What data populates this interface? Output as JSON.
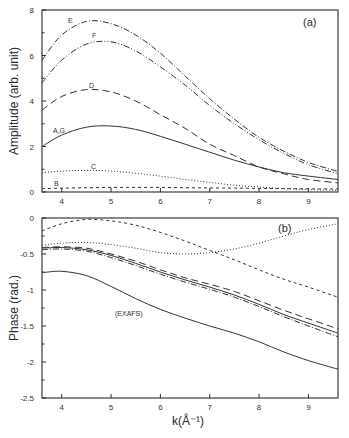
{
  "figure": {
    "xlabel": "k(Å⁻¹)",
    "x_ticks": [
      "4",
      "5",
      "6",
      "7",
      "8",
      "9"
    ]
  },
  "chart_data": [
    {
      "type": "line",
      "panel_label": "(a)",
      "title": "",
      "xlabel": "k(Å⁻¹)",
      "ylabel": "Amplitude (arb. unit)",
      "xlim": [
        3.6,
        9.6
      ],
      "ylim": [
        0,
        8
      ],
      "x_ticks": [
        4,
        5,
        6,
        7,
        8,
        9
      ],
      "y_ticks": [
        0,
        2,
        4,
        6,
        8
      ],
      "y_tick_labels": [
        "0",
        "2",
        "4",
        "6",
        "8"
      ],
      "grid": false,
      "legend": "inline curve labels",
      "x": [
        3.6,
        4.0,
        4.5,
        5.0,
        5.5,
        6.0,
        6.5,
        7.0,
        7.5,
        8.0,
        8.5,
        9.0,
        9.6
      ],
      "series": [
        {
          "name": "E",
          "style": "dash-dot",
          "values": [
            5.8,
            6.9,
            7.5,
            7.4,
            6.9,
            6.1,
            5.1,
            4.1,
            3.2,
            2.4,
            1.8,
            1.3,
            0.9
          ]
        },
        {
          "name": "F",
          "style": "dash-dot-dot",
          "values": [
            4.8,
            5.8,
            6.5,
            6.6,
            6.2,
            5.5,
            4.7,
            3.8,
            3.0,
            2.3,
            1.7,
            1.2,
            0.8
          ]
        },
        {
          "name": "D",
          "style": "dashed",
          "values": [
            3.6,
            4.2,
            4.5,
            4.4,
            4.0,
            3.4,
            2.8,
            2.1,
            1.6,
            1.1,
            0.8,
            0.55,
            0.4
          ]
        },
        {
          "name": "A,G",
          "style": "solid",
          "values": [
            2.0,
            2.5,
            2.85,
            2.9,
            2.75,
            2.45,
            2.1,
            1.75,
            1.4,
            1.1,
            0.85,
            0.7,
            0.55
          ]
        },
        {
          "name": "C",
          "style": "dotted",
          "values": [
            0.85,
            0.92,
            0.95,
            0.92,
            0.82,
            0.7,
            0.55,
            0.42,
            0.3,
            0.22,
            0.15,
            0.1,
            0.08
          ]
        },
        {
          "name": "B",
          "style": "short-dashed",
          "values": [
            0.15,
            0.17,
            0.19,
            0.2,
            0.2,
            0.2,
            0.19,
            0.18,
            0.17,
            0.16,
            0.15,
            0.14,
            0.13
          ]
        }
      ],
      "annotations": [
        "E",
        "F",
        "D",
        "A,G",
        "C",
        "B",
        "(a)"
      ]
    },
    {
      "type": "line",
      "panel_label": "(b)",
      "title": "",
      "xlabel": "k(Å⁻¹)",
      "ylabel": "Phase (rad.)",
      "xlim": [
        3.6,
        9.6
      ],
      "ylim": [
        -2.5,
        0
      ],
      "x_ticks": [
        4,
        5,
        6,
        7,
        8,
        9
      ],
      "y_ticks": [
        0,
        -0.5,
        -1,
        -1.5,
        -2,
        -2.5
      ],
      "y_tick_labels": [
        "0",
        "-0.5",
        "-1",
        "-1.5",
        "-2",
        "-2.5"
      ],
      "grid": false,
      "legend": "inline curve label",
      "x": [
        3.6,
        4.0,
        4.5,
        5.0,
        5.5,
        6.0,
        6.5,
        7.0,
        7.5,
        8.0,
        8.5,
        9.0,
        9.6
      ],
      "series": [
        {
          "name": "short-dashed",
          "style": "short-dashed",
          "values": [
            -0.18,
            -0.08,
            -0.02,
            -0.04,
            -0.1,
            -0.2,
            -0.32,
            -0.45,
            -0.58,
            -0.72,
            -0.85,
            -0.96,
            -1.1
          ]
        },
        {
          "name": "dotted",
          "style": "dotted",
          "values": [
            -0.38,
            -0.35,
            -0.34,
            -0.37,
            -0.42,
            -0.48,
            -0.5,
            -0.48,
            -0.43,
            -0.35,
            -0.25,
            -0.16,
            -0.08
          ]
        },
        {
          "name": "dashed",
          "style": "dashed",
          "values": [
            -0.41,
            -0.4,
            -0.42,
            -0.5,
            -0.6,
            -0.72,
            -0.83,
            -0.92,
            -1.02,
            -1.15,
            -1.28,
            -1.4,
            -1.54
          ]
        },
        {
          "name": "solid",
          "style": "solid",
          "values": [
            -0.42,
            -0.41,
            -0.44,
            -0.52,
            -0.63,
            -0.75,
            -0.86,
            -0.96,
            -1.07,
            -1.2,
            -1.34,
            -1.46,
            -1.6
          ]
        },
        {
          "name": "dash-dot",
          "style": "dash-dot",
          "values": [
            -0.44,
            -0.43,
            -0.46,
            -0.55,
            -0.66,
            -0.78,
            -0.89,
            -0.99,
            -1.1,
            -1.23,
            -1.37,
            -1.5,
            -1.65
          ]
        },
        {
          "name": "(EXAFS)",
          "style": "solid-thin",
          "values": [
            -0.76,
            -0.74,
            -0.8,
            -0.95,
            -1.12,
            -1.27,
            -1.39,
            -1.5,
            -1.6,
            -1.72,
            -1.86,
            -1.98,
            -2.1
          ]
        }
      ],
      "annotations": [
        "(EXAFS)",
        "(b)"
      ]
    }
  ]
}
